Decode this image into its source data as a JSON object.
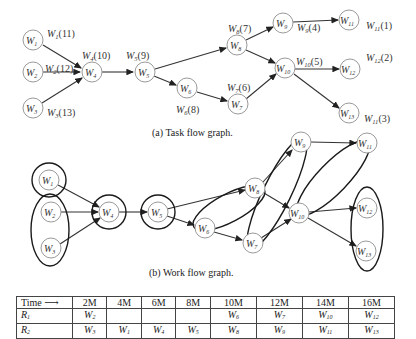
{
  "task_flow_graph": {
    "caption": "(a) Task flow graph.",
    "nodes": [
      {
        "id": "W1",
        "label": "W",
        "sub": "1",
        "x": 33,
        "y": 40
      },
      {
        "id": "W2",
        "label": "W",
        "sub": "2",
        "x": 33,
        "y": 72
      },
      {
        "id": "W3",
        "label": "W",
        "sub": "3",
        "x": 33,
        "y": 108
      },
      {
        "id": "W4",
        "label": "W",
        "sub": "4",
        "x": 92,
        "y": 72
      },
      {
        "id": "W5",
        "label": "W",
        "sub": "5",
        "x": 145,
        "y": 72
      },
      {
        "id": "W6",
        "label": "W",
        "sub": "6",
        "x": 187,
        "y": 88
      },
      {
        "id": "W7",
        "label": "W",
        "sub": "7",
        "x": 238,
        "y": 104
      },
      {
        "id": "W8",
        "label": "W",
        "sub": "8",
        "x": 237,
        "y": 45
      },
      {
        "id": "W9",
        "label": "W",
        "sub": "9",
        "x": 283,
        "y": 23
      },
      {
        "id": "W10",
        "label": "W",
        "sub": "10",
        "x": 285,
        "y": 68
      },
      {
        "id": "W11",
        "label": "W",
        "sub": "11",
        "x": 349,
        "y": 20
      },
      {
        "id": "W12",
        "label": "W",
        "sub": "12",
        "x": 350,
        "y": 69
      },
      {
        "id": "W13",
        "label": "W",
        "sub": "13",
        "x": 349,
        "y": 113
      }
    ],
    "weights": [
      {
        "label": "W",
        "sub": "1",
        "value": "(11)",
        "x": 47,
        "y": 37
      },
      {
        "label": "W",
        "sub": "2",
        "value": "(12)",
        "x": 45,
        "y": 72
      },
      {
        "label": "W",
        "sub": "3",
        "value": "(13)",
        "x": 47,
        "y": 116
      },
      {
        "label": "W",
        "sub": "4",
        "value": "(10)",
        "x": 82,
        "y": 59
      },
      {
        "label": "W",
        "sub": "5",
        "value": "(9)",
        "x": 126,
        "y": 59
      },
      {
        "label": "W",
        "sub": "6",
        "value": "(8)",
        "x": 176,
        "y": 112
      },
      {
        "label": "W",
        "sub": "7",
        "value": "(6)",
        "x": 227,
        "y": 91
      },
      {
        "label": "W",
        "sub": "8",
        "value": "(7)",
        "x": 228,
        "y": 32
      },
      {
        "label": "W",
        "sub": "9",
        "value": "(4)",
        "x": 297,
        "y": 31
      },
      {
        "label": "W",
        "sub": "10",
        "value": "(5)",
        "x": 296,
        "y": 65
      },
      {
        "label": "W",
        "sub": "11",
        "value": "(1)",
        "x": 366,
        "y": 29
      },
      {
        "label": "W",
        "sub": "12",
        "value": "(2)",
        "x": 366,
        "y": 60
      },
      {
        "label": "W",
        "sub": "11",
        "value": "(3)",
        "x": 364,
        "y": 122
      }
    ],
    "edges": [
      [
        "W1",
        "W4"
      ],
      [
        "W2",
        "W4"
      ],
      [
        "W3",
        "W4"
      ],
      [
        "W4",
        "W5"
      ],
      [
        "W5",
        "W8"
      ],
      [
        "W5",
        "W6"
      ],
      [
        "W6",
        "W7"
      ],
      [
        "W8",
        "W9"
      ],
      [
        "W8",
        "W10"
      ],
      [
        "W7",
        "W10"
      ],
      [
        "W9",
        "W11"
      ],
      [
        "W10",
        "W12"
      ],
      [
        "W10",
        "W13"
      ]
    ]
  },
  "work_flow_graph": {
    "caption": "(b) Work flow graph.",
    "groups": [
      [
        "W1"
      ],
      [
        "W2",
        "W3"
      ],
      [
        "W4"
      ],
      [
        "W5"
      ],
      [
        "W6",
        "W8"
      ],
      [
        "W7",
        "W9"
      ],
      [
        "W10",
        "W11"
      ],
      [
        "W12",
        "W13"
      ]
    ]
  },
  "schedule_table": {
    "header": {
      "label": "Time",
      "arrow": "⟶",
      "columns": [
        "2M",
        "4M",
        "6M",
        "8M",
        "10M",
        "12M",
        "14M",
        "16M"
      ]
    },
    "rows": [
      {
        "resource": "R",
        "resource_sub": "1",
        "cells": [
          "W2",
          "",
          "",
          "",
          "W6",
          "W7",
          "W10",
          "W12"
        ]
      },
      {
        "resource": "R",
        "resource_sub": "2",
        "cells": [
          "W3",
          "W1",
          "W4",
          "W5",
          "W8",
          "W9",
          "W11",
          "W13"
        ]
      }
    ]
  },
  "colors": {
    "node_stroke": "#9a9a9a",
    "edge": "#333333",
    "group_outline": "#1a1a1a"
  }
}
